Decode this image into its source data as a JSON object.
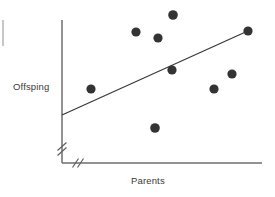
{
  "figure": {
    "type": "scatter-plot",
    "background_color": "#ffffff",
    "ink_color": "#3a3a3a",
    "point_color": "#333333",
    "axis_color": "#6e6e6e",
    "line_color": "#3a3a3a"
  },
  "labels": {
    "y_axis": "Offsping",
    "x_axis": "Parents"
  },
  "chart_data": {
    "type": "scatter",
    "title": "",
    "xlabel": "Parents",
    "ylabel": "Offsping",
    "grid": false,
    "legend": false,
    "axis_break_x": true,
    "axis_break_y": true,
    "xlim": [
      0,
      100
    ],
    "ylim": [
      0,
      100
    ],
    "x": [
      15,
      39,
      51,
      59,
      58,
      49,
      80,
      90,
      99
    ],
    "y": [
      52,
      92,
      88,
      105,
      68,
      27,
      52,
      62,
      93
    ],
    "points": [
      {
        "x": 15,
        "y": 52
      },
      {
        "x": 39,
        "y": 92
      },
      {
        "x": 51,
        "y": 88
      },
      {
        "x": 59,
        "y": 105
      },
      {
        "x": 58,
        "y": 68
      },
      {
        "x": 49,
        "y": 27
      },
      {
        "x": 80,
        "y": 52
      },
      {
        "x": 90,
        "y": 62
      },
      {
        "x": 99,
        "y": 93
      }
    ],
    "trend_line": {
      "type": "linear-fit",
      "x_start": 0,
      "y_start": 35,
      "x_end": 100,
      "y_end": 94
    }
  },
  "pixels": {
    "plot": {
      "y_axis_x": 62,
      "y_axis_top": 20,
      "y_axis_bottom": 163,
      "x_axis_y": 163,
      "x_axis_left": 62,
      "x_axis_right": 262
    },
    "points": [
      {
        "cx": 91,
        "cy": 89,
        "r": 4.6
      },
      {
        "cx": 136,
        "cy": 32,
        "r": 4.6
      },
      {
        "cx": 158,
        "cy": 38,
        "r": 4.6
      },
      {
        "cx": 173,
        "cy": 15,
        "r": 4.8
      },
      {
        "cx": 172,
        "cy": 70,
        "r": 4.6
      },
      {
        "cx": 155,
        "cy": 128,
        "r": 4.8
      },
      {
        "cx": 214,
        "cy": 89,
        "r": 4.6
      },
      {
        "cx": 232,
        "cy": 74,
        "r": 4.6
      },
      {
        "cx": 248,
        "cy": 31,
        "r": 4.6
      }
    ],
    "trend_line": {
      "x1": 62,
      "y1": 115,
      "x2": 250,
      "y2": 30
    },
    "break_y": {
      "x": 62,
      "y_center": 148
    },
    "break_x": {
      "y": 163,
      "x_center": 77
    },
    "edge_mark": {
      "x": 3,
      "y1": 20,
      "y2": 46
    }
  }
}
